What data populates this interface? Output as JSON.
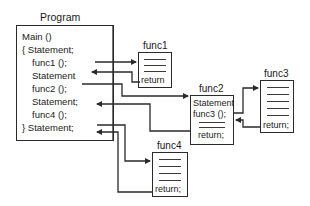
{
  "program": {
    "title": "Program",
    "lines": [
      "Main ()",
      "{  Statement;",
      "func1 ();",
      "Statement",
      "func2 ();",
      "Statement;",
      "func4 ();",
      "}  Statement;"
    ]
  },
  "func1": {
    "title": "func1",
    "return": "return"
  },
  "func2": {
    "title": "func2",
    "lines": [
      "Statement",
      "func3 ();"
    ],
    "return": "return;"
  },
  "func3": {
    "title": "func3",
    "return": "return;"
  },
  "func4": {
    "title": "func4",
    "return": "return;"
  },
  "colors": {
    "line": "#2a2a2a",
    "background": "#ffffff"
  }
}
